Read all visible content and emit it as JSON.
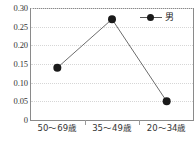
{
  "chart_data": {
    "type": "line",
    "title": "",
    "subtitle": "",
    "xlabel": "",
    "ylabel": "",
    "categories": [
      "50〜69歳",
      "35〜49歳",
      "20〜34歳"
    ],
    "series": [
      {
        "name": "男",
        "values": [
          0.14,
          0.27,
          0.05
        ],
        "marker": "filled-circle",
        "color": "#1a1a1a",
        "line_color": "#6e6e6e"
      }
    ],
    "ylim": [
      0,
      0.3
    ],
    "yticks": [
      "0.30",
      "0.25",
      "0.20",
      "0.15",
      "0.10",
      "0.05",
      "0"
    ],
    "ytick_values": [
      0.3,
      0.25,
      0.2,
      0.15,
      0.1,
      0.05,
      0
    ],
    "grid": true,
    "grid_axis": "y",
    "grid_style": "dotted",
    "legend_position": "top-right",
    "legend_entries": [
      "男"
    ],
    "annotations": []
  },
  "legend": {
    "entry_label": "男",
    "marker_icon": "filled-circle-marker-icon"
  },
  "axes": {
    "y_tick_labels": [
      "0.30",
      "0.25",
      "0.20",
      "0.15",
      "0.10",
      "0.05",
      "0"
    ],
    "x_tick_labels": [
      "50〜69歳",
      "35〜49歳",
      "20〜34歳"
    ]
  }
}
